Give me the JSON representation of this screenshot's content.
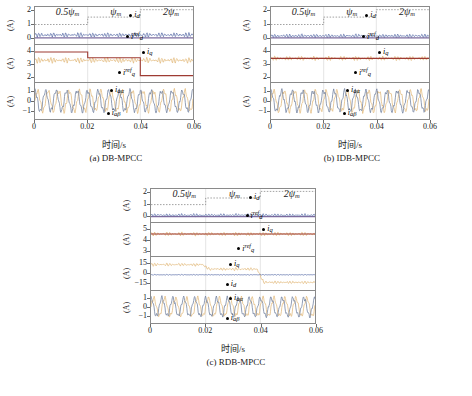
{
  "figure": {
    "xlabel": "时间/s",
    "ylabel": "(A)",
    "xticks": [
      "0",
      "0.02",
      "0.04",
      "0.06"
    ],
    "flux_labels": {
      "left": "0.5",
      "mid": "",
      "right": "2",
      "symbol": "ψ",
      "sub": "m"
    },
    "colors": {
      "blue": "#5a6ea8",
      "purple": "#7b6b9e",
      "maroon": "#9e3b33",
      "tan": "#e2b87a",
      "gray_blue": "#6d7d9c",
      "axis": "#8a8a8a",
      "step": "#6b6b6b"
    }
  },
  "subplots": [
    {
      "caption": "(a) DB-MPCC",
      "panels": [
        {
          "ylabel": "(A)",
          "yticks": [
            "0",
            "1",
            "2"
          ],
          "ymin": -0.45,
          "ymax": 2.3,
          "annotations": [
            {
              "name": "id",
              "text": "i",
              "sub": "d",
              "sup": ""
            },
            {
              "name": "id-ref",
              "text": "i",
              "sub": "d",
              "sup": "ref"
            }
          ]
        },
        {
          "ylabel": "(A)",
          "yticks": [
            "2",
            "3",
            "4"
          ],
          "ymin": 1.6,
          "ymax": 4.5,
          "annotations": [
            {
              "name": "iq",
              "text": "i",
              "sub": "q",
              "sup": ""
            },
            {
              "name": "iq-ref",
              "text": "i",
              "sub": "q",
              "sup": "ref"
            }
          ]
        },
        {
          "ylabel": "(A)",
          "yticks": [
            "-1",
            "0",
            "1"
          ],
          "ymin": -1.9,
          "ymax": 1.9,
          "annotations": [
            {
              "name": "i-alpha",
              "text": "i",
              "sub": "aα",
              "sup": ""
            },
            {
              "name": "i-beta",
              "text": "i",
              "sub": "aβ",
              "sup": ""
            }
          ]
        }
      ]
    },
    {
      "caption": "(b) IDB-MPCC",
      "panels": [
        {
          "ylabel": "(A)",
          "yticks": [
            "0",
            "1",
            "2"
          ],
          "ymin": -0.45,
          "ymax": 2.3,
          "annotations": [
            {
              "name": "id",
              "text": "i",
              "sub": "d",
              "sup": ""
            },
            {
              "name": "id-ref",
              "text": "i",
              "sub": "d",
              "sup": "ref"
            }
          ]
        },
        {
          "ylabel": "(A)",
          "yticks": [
            "2",
            "3",
            "4"
          ],
          "ymin": 1.6,
          "ymax": 4.5,
          "annotations": [
            {
              "name": "iq",
              "text": "i",
              "sub": "q",
              "sup": ""
            },
            {
              "name": "iq-ref",
              "text": "i",
              "sub": "q",
              "sup": "ref"
            }
          ]
        },
        {
          "ylabel": "(A)",
          "yticks": [
            "-1",
            "0",
            "1"
          ],
          "ymin": -1.9,
          "ymax": 1.9,
          "annotations": [
            {
              "name": "i-alpha",
              "text": "i",
              "sub": "aα",
              "sup": ""
            },
            {
              "name": "i-beta",
              "text": "i",
              "sub": "aβ",
              "sup": ""
            }
          ]
        }
      ]
    },
    {
      "caption": "(c) RDB-MPCC",
      "panels": [
        {
          "ylabel": "(A)",
          "yticks": [
            "0",
            "1",
            "2"
          ],
          "ymin": -0.45,
          "ymax": 2.3,
          "annotations": [
            {
              "name": "id",
              "text": "i",
              "sub": "d",
              "sup": ""
            },
            {
              "name": "id-ref",
              "text": "i",
              "sub": "d",
              "sup": "ref"
            }
          ]
        },
        {
          "ylabel": "(A)",
          "yticks": [
            "3",
            "4",
            "5"
          ],
          "ymin": 2.6,
          "ymax": 5.6,
          "annotations": [
            {
              "name": "iq",
              "text": "i",
              "sub": "q",
              "sup": ""
            },
            {
              "name": "iq-ref",
              "text": "i",
              "sub": "q",
              "sup": "ref"
            }
          ]
        },
        {
          "ylabel": "(A)",
          "yticks": [
            "-15",
            "0",
            "15"
          ],
          "ymin": -26,
          "ymax": 26,
          "annotations": [
            {
              "name": "iq",
              "text": "i",
              "sub": "q",
              "sup": ""
            },
            {
              "name": "id",
              "text": "i",
              "sub": "d",
              "sup": ""
            }
          ]
        },
        {
          "ylabel": "(A)",
          "yticks": [
            "-1",
            "0",
            "1"
          ],
          "ymin": -1.9,
          "ymax": 1.9,
          "annotations": [
            {
              "name": "i-alpha",
              "text": "i",
              "sub": "aα",
              "sup": ""
            },
            {
              "name": "i-beta",
              "text": "i",
              "sub": "aβ",
              "sup": ""
            }
          ]
        }
      ]
    }
  ],
  "chart_data": {
    "type": "line",
    "title": "",
    "xlabel": "时间/s",
    "ylabel": "(A)",
    "xlim": [
      0,
      0.06
    ],
    "xticks": [
      0,
      0.02,
      0.04,
      0.06
    ],
    "grid": false,
    "legend": "inline-annotations",
    "flux_segments": [
      {
        "label": "0.5ψm",
        "x_range": [
          0,
          0.02
        ],
        "level": 1.0
      },
      {
        "label": "ψm",
        "x_range": [
          0.02,
          0.04
        ],
        "level": 1.55
      },
      {
        "label": "2ψm",
        "x_range": [
          0.04,
          0.06
        ],
        "level": 2.1
      }
    ],
    "subplots": [
      {
        "name": "(a) DB-MPCC",
        "panels": [
          {
            "name": "d-axis current",
            "ylim": [
              -0.45,
              2.3
            ],
            "yticks": [
              0,
              1,
              2
            ],
            "series": [
              {
                "name": "id",
                "color": "#5a6ea8",
                "type": "ripple",
                "mean": 0.22,
                "ripple": 0.16
              },
              {
                "name": "id_ref",
                "color": "#7b6b9e",
                "type": "step",
                "values": [
                  0,
                  0,
                  0
                ]
              }
            ]
          },
          {
            "name": "q-axis current",
            "ylim": [
              1.6,
              4.5
            ],
            "yticks": [
              2,
              3,
              4
            ],
            "series": [
              {
                "name": "iq",
                "color": "#e2b87a",
                "type": "ripple",
                "mean": 3.3,
                "ripple": 0.2
              },
              {
                "name": "iq_ref",
                "color": "#9e3b33",
                "type": "step",
                "values": [
                  3.95,
                  3.5,
                  2.1
                ],
                "note": "drops at 0.02 and 0.04, steady-state error vs iq"
              }
            ]
          },
          {
            "name": "alpha-beta currents",
            "ylim": [
              -1.9,
              1.9
            ],
            "yticks": [
              -1,
              0,
              1
            ],
            "series": [
              {
                "name": "i_a_alpha",
                "color": "#e2b87a",
                "type": "sine",
                "amplitude": 1.05,
                "freq_hz": 250
              },
              {
                "name": "i_a_beta",
                "color": "#6d7d9c",
                "type": "sine",
                "amplitude": 1.05,
                "freq_hz": 250,
                "phase_deg": 90
              }
            ]
          }
        ]
      },
      {
        "name": "(b) IDB-MPCC",
        "panels": [
          {
            "name": "d-axis current",
            "ylim": [
              -0.45,
              2.3
            ],
            "yticks": [
              0,
              1,
              2
            ],
            "series": [
              {
                "name": "id",
                "color": "#5a6ea8",
                "type": "ripple",
                "mean": 0.15,
                "ripple": 0.13
              },
              {
                "name": "id_ref",
                "color": "#7b6b9e",
                "type": "step",
                "values": [
                  0,
                  0,
                  0
                ]
              }
            ]
          },
          {
            "name": "q-axis current",
            "ylim": [
              1.6,
              4.5
            ],
            "yticks": [
              2,
              3,
              4
            ],
            "series": [
              {
                "name": "iq",
                "color": "#e2b87a",
                "type": "ripple",
                "mean": 3.45,
                "ripple": 0.16
              },
              {
                "name": "iq_ref",
                "color": "#9e3b33",
                "type": "step",
                "values": [
                  3.45,
                  3.45,
                  3.45
                ],
                "note": "tracks reference with no steady-state offset"
              }
            ]
          },
          {
            "name": "alpha-beta currents",
            "ylim": [
              -1.9,
              1.9
            ],
            "yticks": [
              -1,
              0,
              1
            ],
            "series": [
              {
                "name": "i_a_alpha",
                "color": "#e2b87a",
                "type": "sine",
                "amplitude": 1.05,
                "freq_hz": 250
              },
              {
                "name": "i_a_beta",
                "color": "#6d7d9c",
                "type": "sine",
                "amplitude": 1.05,
                "freq_hz": 250,
                "phase_deg": 90
              }
            ]
          }
        ]
      },
      {
        "name": "(c) RDB-MPCC",
        "panels": [
          {
            "name": "d-axis current",
            "ylim": [
              -0.45,
              2.3
            ],
            "yticks": [
              0,
              1,
              2
            ],
            "series": [
              {
                "name": "id",
                "color": "#5a6ea8",
                "type": "ripple",
                "mean": 0.12,
                "ripple": 0.12
              },
              {
                "name": "id_ref",
                "color": "#7b6b9e",
                "type": "step",
                "values": [
                  0,
                  0,
                  0
                ]
              }
            ]
          },
          {
            "name": "q-axis current",
            "ylim": [
              2.6,
              5.6
            ],
            "yticks": [
              3,
              4,
              5
            ],
            "series": [
              {
                "name": "iq",
                "color": "#e2b87a",
                "type": "ripple",
                "mean": 4.6,
                "ripple": 0.16
              },
              {
                "name": "iq_ref",
                "color": "#9e3b33",
                "type": "step",
                "values": [
                  4.6,
                  4.6,
                  4.6
                ]
              }
            ]
          },
          {
            "name": "dq currents wide scale",
            "ylim": [
              -26,
              26
            ],
            "yticks": [
              -15,
              0,
              15
            ],
            "series": [
              {
                "name": "iq",
                "color": "#e2b87a",
                "type": "ripple",
                "mean_segments": [
                  14,
                  7,
                  -14
                ],
                "ripple": 2.2
              },
              {
                "name": "id",
                "color": "#5a6ea8",
                "type": "ripple",
                "mean": -2,
                "ripple": 0.6
              }
            ]
          },
          {
            "name": "alpha-beta currents",
            "ylim": [
              -1.9,
              1.9
            ],
            "yticks": [
              -1,
              0,
              1
            ],
            "series": [
              {
                "name": "i_a_alpha",
                "color": "#e2b87a",
                "type": "sine",
                "amplitude": 1.05,
                "freq_hz": 250
              },
              {
                "name": "i_a_beta",
                "color": "#6d7d9c",
                "type": "sine",
                "amplitude": 1.05,
                "freq_hz": 250,
                "phase_deg": 90
              }
            ]
          }
        ]
      }
    ]
  }
}
